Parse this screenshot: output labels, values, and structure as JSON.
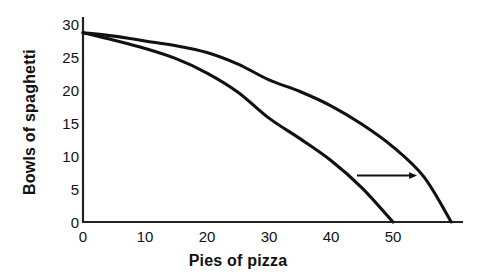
{
  "chart_data": {
    "type": "line",
    "title": "",
    "xlabel": "Pies of pizza",
    "ylabel": "Bowls of spaghetti",
    "xlim": [
      0,
      61.3
    ],
    "ylim": [
      0,
      30
    ],
    "xticks": [
      0,
      10,
      20,
      30,
      40,
      50
    ],
    "yticks": [
      0,
      5,
      10,
      15,
      20,
      25,
      30
    ],
    "xtick_labels": [
      "0",
      "10",
      "20",
      "30",
      "40",
      "50"
    ],
    "ytick_labels": [
      "0",
      "5",
      "10",
      "15",
      "20",
      "25",
      "30"
    ],
    "grid": false,
    "legend": "none",
    "series": [
      {
        "name": "inner-ppf",
        "color": "#111111",
        "x": [
          0,
          5,
          10,
          15,
          20,
          25,
          30,
          35,
          40,
          45,
          50
        ],
        "y": [
          27.7,
          26.6,
          25.4,
          23.9,
          21.8,
          19.0,
          15.2,
          12.2,
          9.0,
          5.0,
          0.0
        ]
      },
      {
        "name": "outer-ppf",
        "color": "#111111",
        "x": [
          0,
          5,
          10,
          15,
          20,
          25,
          30,
          35,
          40,
          45,
          50,
          55,
          59.4
        ],
        "y": [
          27.7,
          27.2,
          26.5,
          25.8,
          24.8,
          23.1,
          20.8,
          19.1,
          17.0,
          14.3,
          11.0,
          6.6,
          0.0
        ]
      }
    ],
    "annotations": [
      {
        "name": "shift-arrow",
        "type": "arrow",
        "x_start": 44.2,
        "x_end": 53.9,
        "y": 6.8,
        "direction": "right",
        "color": "#111111"
      }
    ]
  },
  "axis_labels": {
    "y_title": "Bowls of spaghetti",
    "x_title": "Pies of pizza"
  },
  "colors": {
    "ink": "#111111",
    "background": "#ffffff",
    "axis": "#222222"
  }
}
